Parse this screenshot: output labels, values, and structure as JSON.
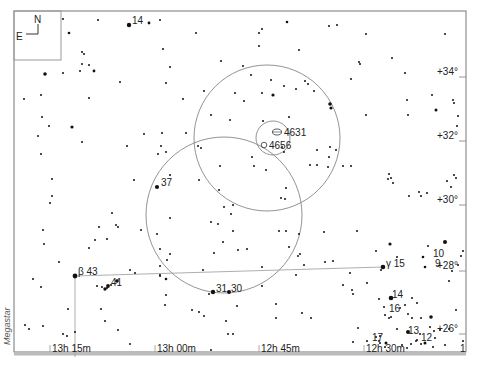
{
  "chart_data": {
    "type": "scatter",
    "title": "",
    "credit": "Megastar",
    "compass": {
      "north": "N",
      "east": "E"
    },
    "x_axis": {
      "label": "Right Ascension",
      "ticks": [
        "13h 15m",
        "13h 00m",
        "12h 45m",
        "12h 30m"
      ]
    },
    "y_axis": {
      "label": "Declination",
      "ticks": [
        "+34°",
        "+32°",
        "+30°",
        "+28°",
        "+26°"
      ]
    },
    "corner_marker": "1",
    "deep_sky_objects": [
      {
        "id": "4631",
        "label": "4631",
        "kind": "galaxy"
      },
      {
        "id": "4656",
        "label": "4656",
        "kind": "galaxy"
      }
    ],
    "labeled_stars": [
      {
        "label": "14",
        "name": "star-14-top"
      },
      {
        "label": "37",
        "name": "star-37"
      },
      {
        "label": "β 43",
        "name": "star-beta-43"
      },
      {
        "label": "41",
        "name": "star-41"
      },
      {
        "label": "31",
        "name": "star-31"
      },
      {
        "label": "30",
        "name": "star-30"
      },
      {
        "label": "γ 15",
        "name": "star-gamma-15"
      },
      {
        "label": "10",
        "name": "star-10"
      },
      {
        "label": "9",
        "name": "star-9"
      },
      {
        "label": "14",
        "name": "star-14-bottom"
      },
      {
        "label": "16",
        "name": "star-16"
      },
      {
        "label": "17",
        "name": "star-17"
      },
      {
        "label": "13",
        "name": "star-13"
      },
      {
        "label": "12",
        "name": "star-12"
      }
    ],
    "finder_circles": [
      "large-circle-upper",
      "large-circle-lower",
      "small-circle-center"
    ]
  }
}
